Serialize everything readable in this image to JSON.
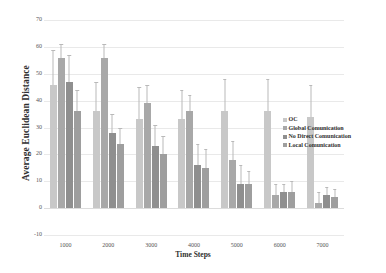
{
  "chart_data": {
    "type": "bar",
    "title": "",
    "xlabel": "Time Steps",
    "ylabel": "Average Euclidean Distance",
    "categories": [
      "1000",
      "2000",
      "3000",
      "4000",
      "5000",
      "6000",
      "7000"
    ],
    "ylim": [
      -10,
      70
    ],
    "yticks": [
      "70",
      "60",
      "50",
      "40",
      "30",
      "20",
      "10",
      "0",
      "-10"
    ],
    "ytick_values": [
      70,
      60,
      50,
      40,
      30,
      20,
      10,
      0,
      -10
    ],
    "grid": true,
    "legend_position": "right",
    "series": [
      {
        "name": "OC",
        "color": "#c8c8c8",
        "values": [
          46,
          36,
          33,
          33,
          36,
          36,
          34
        ],
        "errors": [
          13,
          11,
          12,
          11,
          12,
          12,
          12
        ]
      },
      {
        "name": "Global Comunication",
        "color": "#a8a8a8",
        "values": [
          56,
          56,
          39,
          36,
          18,
          5,
          2
        ],
        "errors": [
          5,
          5,
          7,
          6,
          7,
          4,
          4
        ]
      },
      {
        "name": "No Direct Comunication",
        "color": "#8f8f8f",
        "values": [
          47,
          28,
          23,
          16,
          9,
          6,
          5
        ]
      },
      {
        "name": "Local Comunication",
        "color": "#9e9e9e",
        "values": [
          36,
          24,
          20,
          15,
          9,
          6,
          4
        ],
        "errors": [
          8,
          6,
          7,
          7,
          5,
          4,
          3
        ]
      }
    ],
    "errors_no_direct": [
      10,
      7,
      8,
      8,
      7,
      3,
      3
    ]
  },
  "colors": {
    "grid": "#e9e9e9",
    "axis_text": "#555555",
    "label_text": "#2f2f2f",
    "error_bar": "#b9b9b9",
    "background": "#ffffff"
  }
}
